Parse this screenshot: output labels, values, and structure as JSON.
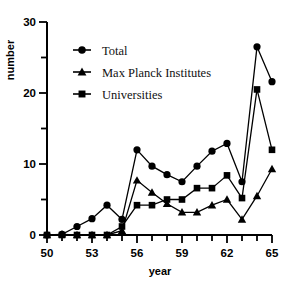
{
  "chart_data": {
    "type": "line",
    "title": "",
    "xlabel": "year",
    "ylabel": "number",
    "xlim": [
      50,
      65
    ],
    "ylim": [
      0,
      30
    ],
    "xticks": [
      50,
      51,
      52,
      53,
      54,
      55,
      56,
      57,
      58,
      59,
      60,
      61,
      62,
      63,
      64,
      65
    ],
    "xtick_labels": [
      "50",
      "",
      "",
      "53",
      "",
      "",
      "56",
      "",
      "",
      "59",
      "",
      "",
      "62",
      "",
      "",
      "65"
    ],
    "yticks": [
      0,
      5,
      10,
      15,
      20,
      25,
      30
    ],
    "ytick_labels": [
      "0",
      "",
      "10",
      "",
      "20",
      "",
      "30"
    ],
    "grid": false,
    "legend_position": "upper left",
    "x": [
      50,
      51,
      52,
      53,
      54,
      55,
      56,
      57,
      58,
      59,
      60,
      61,
      62,
      63,
      64,
      65
    ],
    "series": [
      {
        "name": "Total",
        "marker": "circle",
        "color": "#000000",
        "values": [
          0,
          0.1,
          1.2,
          2.3,
          4.2,
          2.2,
          12.0,
          9.7,
          8.5,
          7.5,
          9.7,
          11.8,
          12.9,
          7.5,
          26.5,
          21.6
        ]
      },
      {
        "name": "Max Planck Institutes",
        "marker": "triangle",
        "color": "#000000",
        "values": [
          0,
          0.1,
          0,
          0,
          0,
          0.6,
          7.7,
          6.0,
          4.4,
          3.2,
          3.2,
          4.2,
          5.0,
          2.2,
          5.5,
          9.3
        ]
      },
      {
        "name": "Universities",
        "marker": "square",
        "color": "#000000",
        "values": [
          0,
          0,
          0,
          0,
          0,
          1.2,
          4.2,
          4.2,
          5.0,
          5.0,
          6.6,
          6.6,
          8.4,
          5.2,
          20.5,
          12.0
        ]
      }
    ]
  },
  "legend": {
    "entries": [
      {
        "label": "Total",
        "marker": "circle"
      },
      {
        "label": "Max Planck Institutes",
        "marker": "triangle"
      },
      {
        "label": "Universities",
        "marker": "square"
      }
    ]
  },
  "axes": {
    "y_axis_label": "number",
    "x_axis_label": "year"
  }
}
